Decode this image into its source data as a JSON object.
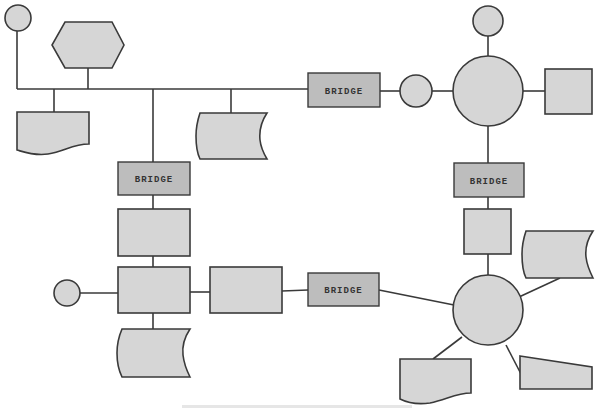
{
  "diagram": {
    "bridge_label": "BRIDGE",
    "node_labels": {
      "bridge_top": "BRIDGE",
      "bridge_left": "BRIDGE",
      "bridge_right": "BRIDGE",
      "bridge_bottom": "BRIDGE"
    },
    "caption": "",
    "colors": {
      "node_fill": "#d6d6d6",
      "bridge_fill": "#bdbdbd",
      "stroke": "#3a3a3a",
      "background": "#ffffff"
    }
  }
}
